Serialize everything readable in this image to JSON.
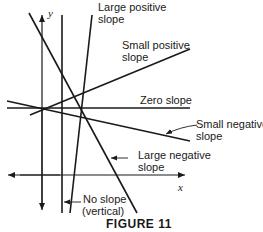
{
  "figure": {
    "caption": "FIGURE 11",
    "axes": {
      "x_label": "x",
      "y_label": "y"
    },
    "labels": {
      "large_positive": [
        "Large positive",
        "slope"
      ],
      "small_positive": [
        "Small positive",
        "slope"
      ],
      "zero": [
        "Zero slope"
      ],
      "small_negative": [
        "Small negative",
        "slope"
      ],
      "large_negative": [
        "Large negative",
        "slope"
      ],
      "vertical": [
        "No slope",
        "(vertical)"
      ]
    },
    "colors": {
      "line": "#1a1a1a",
      "background": "#ffffff"
    }
  }
}
